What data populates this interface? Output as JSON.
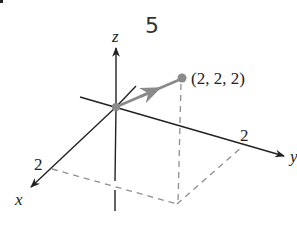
{
  "figure": {
    "handwritten_note": "5",
    "axes": {
      "x_label": "x",
      "y_label": "y",
      "z_label": "z",
      "x_tick_label": "2",
      "y_tick_label": "2"
    },
    "point": {
      "label": "(2, 2, 2)",
      "coords": [
        2,
        2,
        2
      ]
    },
    "vector": {
      "from": [
        0,
        0,
        0
      ],
      "to": [
        2,
        2,
        2
      ]
    },
    "colors": {
      "axis": "#222222",
      "vector": "#8a8a8a",
      "point": "#8a8a8a",
      "dashed": "#8f8f8f"
    }
  }
}
